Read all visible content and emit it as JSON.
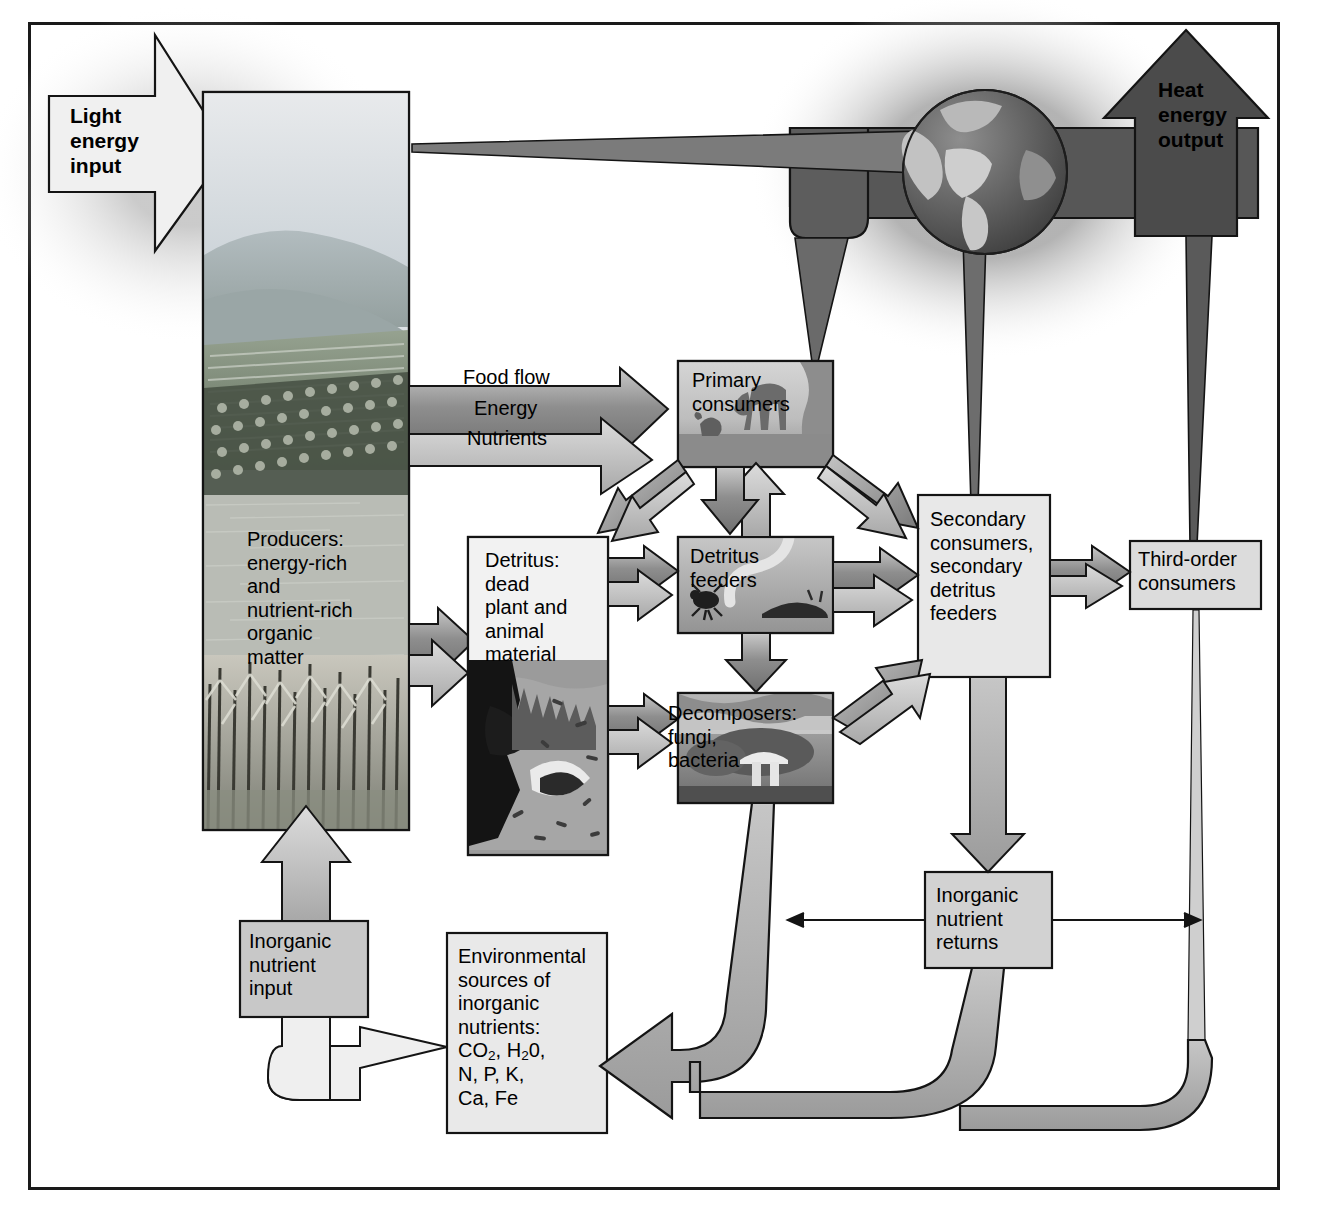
{
  "diagram": {
    "frame": {
      "border_color": "#1a1a1a"
    },
    "inputs": {
      "light_energy": "Light energy\ninput",
      "inorganic_nutrient_input": "Inorganic\nnutrient\ninput"
    },
    "outputs": {
      "heat_energy": "Heat\nenergy\noutput"
    },
    "flow_labels": {
      "food_flow": "Food flow",
      "energy": "Energy",
      "nutrients": "Nutrients"
    },
    "boxes": {
      "producers": "Producers:\nenergy-rich\nand\nnutrient-rich\norganic\nmatter",
      "detritus": "Detritus:\ndead\nplant and\nanimal\nmaterial",
      "primary_consumers": "Primary\nconsumers",
      "detritus_feeders": "Detritus\nfeeders",
      "decomposers": "Decomposers:\nfungi,\nbacteria",
      "secondary_consumers": "Secondary\nconsumers,\nsecondary\ndetritus\nfeeders",
      "third_order_consumers": "Third-order\nconsumers",
      "inorganic_nutrient_returns": "Inorganic\nnutrient\nreturns",
      "environmental_sources_head": "Environmental\nsources of\ninorganic\nnutrients:",
      "environmental_sources_formula_1_pre": "CO",
      "environmental_sources_formula_1_sub": "2",
      "environmental_sources_formula_1_mid": ", H",
      "environmental_sources_formula_1_sub2": "2",
      "environmental_sources_formula_1_post": "0,",
      "environmental_sources_formula_2": "N, P, K,",
      "environmental_sources_formula_3": "Ca, Fe"
    },
    "icons": {
      "globe": "globe-icon",
      "deer": "deer-icon",
      "worm": "worm-icon",
      "mushroom": "mushroom-icon"
    },
    "colors": {
      "heat_dark": "#4e4e4e",
      "heat_mid": "#7d7d7d",
      "food_arrow": "#8c8c8c",
      "nutrient_arrow": "#b4b4b4",
      "box_fill": "#dcdcdc",
      "outline": "#1a1a1a",
      "sky": "#cfd4d8",
      "field": "#7d8b7a"
    }
  }
}
